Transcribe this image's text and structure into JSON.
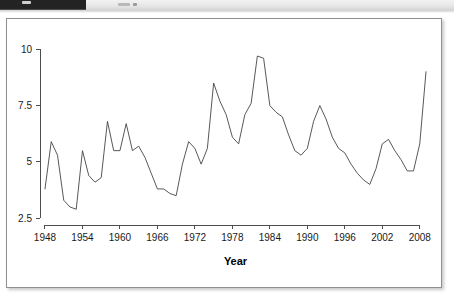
{
  "top_strip": {
    "icons": [
      "app-badge-icon",
      "toolbar-tick-icon",
      "toolbar-tick-icon"
    ]
  },
  "chart_data": {
    "type": "line",
    "title": "",
    "subtitle": "",
    "xlabel": "Year",
    "ylabel": "",
    "xlim": [
      1947.2,
      2009.8
    ],
    "ylim": [
      2.2,
      10.1
    ],
    "grid": false,
    "legend": null,
    "xticks": [
      1948,
      1954,
      1960,
      1966,
      1972,
      1978,
      1984,
      1990,
      1996,
      2002,
      2008
    ],
    "xtick_labels": [
      "1948",
      "1954",
      "1960",
      "1966",
      "1972",
      "1978",
      "1984",
      "1990",
      "1996",
      "2002",
      "2008"
    ],
    "yticks": [
      2.5,
      5,
      7.5,
      10
    ],
    "ytick_labels": [
      "2.5",
      "5",
      "7.5",
      "10"
    ],
    "line_color": "#454545",
    "series": [
      {
        "name": "Unemployment rate",
        "x": [
          1948,
          1949,
          1950,
          1951,
          1952,
          1953,
          1954,
          1955,
          1956,
          1957,
          1958,
          1959,
          1960,
          1961,
          1962,
          1963,
          1964,
          1965,
          1966,
          1967,
          1968,
          1969,
          1970,
          1971,
          1972,
          1973,
          1974,
          1975,
          1976,
          1977,
          1978,
          1979,
          1980,
          1981,
          1982,
          1983,
          1984,
          1985,
          1986,
          1987,
          1988,
          1989,
          1990,
          1991,
          1992,
          1993,
          1994,
          1995,
          1996,
          1997,
          1998,
          1999,
          2000,
          2001,
          2002,
          2003,
          2004,
          2005,
          2006,
          2007,
          2008,
          2009
        ],
        "values": [
          3.8,
          5.9,
          5.3,
          3.3,
          3.0,
          2.9,
          5.5,
          4.4,
          4.1,
          4.3,
          6.8,
          5.5,
          5.5,
          6.7,
          5.5,
          5.7,
          5.2,
          4.5,
          3.8,
          3.8,
          3.6,
          3.5,
          4.9,
          5.9,
          5.6,
          4.9,
          5.6,
          8.5,
          7.7,
          7.1,
          6.1,
          5.8,
          7.1,
          7.6,
          9.7,
          9.6,
          7.5,
          7.2,
          7.0,
          6.2,
          5.5,
          5.3,
          5.6,
          6.8,
          7.5,
          6.9,
          6.1,
          5.6,
          5.4,
          4.9,
          4.5,
          4.2,
          4.0,
          4.7,
          5.8,
          6.0,
          5.5,
          5.1,
          4.6,
          4.6,
          5.8,
          9.0
        ]
      }
    ]
  }
}
